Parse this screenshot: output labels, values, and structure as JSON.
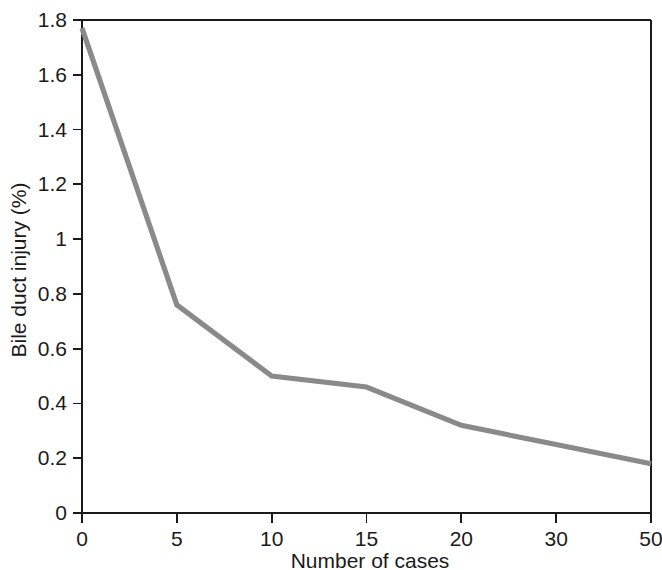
{
  "chart_data": {
    "type": "line",
    "title": "",
    "subtitle": "",
    "xlabel": "Number of cases",
    "ylabel": "Bile duct injury (%)",
    "categories": [
      "0",
      "5",
      "10",
      "15",
      "20",
      "30",
      "50"
    ],
    "values": [
      1.77,
      0.76,
      0.5,
      0.46,
      0.32,
      0.25,
      0.18
    ],
    "series": [
      {
        "name": "Bile duct injury rate",
        "color": "#8a8a8a",
        "values": [
          1.77,
          0.76,
          0.5,
          0.46,
          0.32,
          0.25,
          0.18
        ]
      }
    ],
    "x_tick_labels": [
      "0",
      "5",
      "10",
      "15",
      "20",
      "30",
      "50"
    ],
    "y_tick_labels": [
      "0",
      "0.2",
      "0.4",
      "0.6",
      "0.8",
      "1",
      "1.2",
      "1.4",
      "1.6",
      "1.8"
    ],
    "y_tick_values": [
      0,
      0.2,
      0.4,
      0.6,
      0.8,
      1,
      1.2,
      1.4,
      1.6,
      1.8
    ],
    "ylim": [
      0,
      1.8
    ],
    "x_scale": "categorical",
    "grid": false,
    "legend": "none",
    "line_color": "#8a8a8a",
    "axis_color": "#1a1a1a",
    "background_color": "#ffffff",
    "markers": false,
    "annotations": []
  },
  "axis_titles": {
    "x": "Number of cases",
    "y": "Bile duct injury (%)"
  }
}
